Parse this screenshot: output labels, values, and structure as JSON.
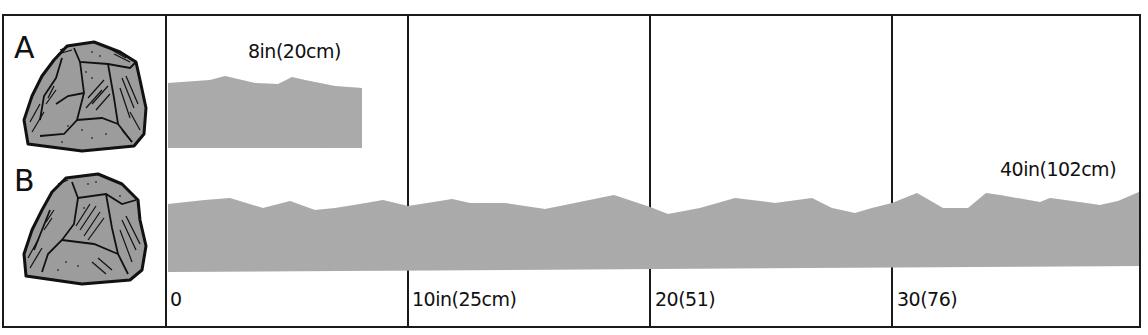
{
  "figure": {
    "rows": [
      {
        "id": "A",
        "label": "A",
        "length_label": "8in(20cm)",
        "length_in": 8,
        "length_cm": 20
      },
      {
        "id": "B",
        "label": "B",
        "length_label": "40in(102cm)",
        "length_in": 40,
        "length_cm": 102
      }
    ],
    "scale_ticks": [
      {
        "label": "0",
        "value_in": 0
      },
      {
        "label": "10in(25cm)",
        "value_in": 10,
        "value_cm": 25
      },
      {
        "label": "20(51)",
        "value_in": 20,
        "value_cm": 51
      },
      {
        "label": "30(76)",
        "value_in": 30,
        "value_cm": 76
      }
    ],
    "icons": [
      "rock-icon-a",
      "rock-icon-b"
    ],
    "colors": {
      "bar_fill": "#a9a9a9",
      "rock_fill": "#9c9c9c",
      "line": "#1a1a1a",
      "background": "#ffffff"
    }
  }
}
